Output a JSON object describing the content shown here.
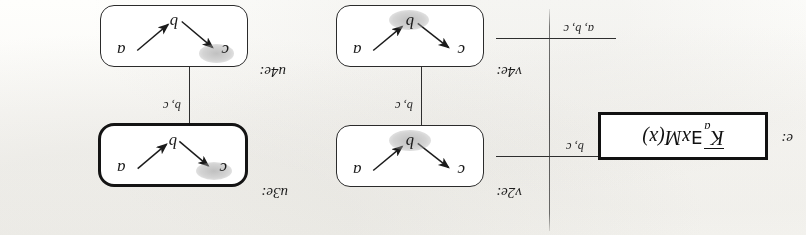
{
  "figure": {
    "orientation": "upside-down (rotated 180 degrees)",
    "worlds": [
      {
        "id": "w-top-left",
        "label": "u4e:",
        "atoms": {
          "a": "a",
          "b": "b",
          "c": "c"
        },
        "highlighted_atom": "c",
        "bold_border": false
      },
      {
        "id": "w-top-right",
        "label": "v4e:",
        "atoms": {
          "a": "a",
          "b": "b",
          "c": "c"
        },
        "highlighted_atom": "b",
        "bold_border": false
      },
      {
        "id": "w-bottom-left",
        "label": "u3e:",
        "atoms": {
          "a": "a",
          "b": "b",
          "c": "c"
        },
        "highlighted_atom": "c",
        "bold_border": true
      },
      {
        "id": "w-bottom-right",
        "label": "v2e:",
        "atoms": {
          "a": "a",
          "b": "b",
          "c": "c"
        },
        "highlighted_atom": "b",
        "bold_border": false
      }
    ],
    "edges": [
      {
        "id": "edge-top",
        "label": "a, b, c"
      },
      {
        "id": "edge-left",
        "label": "b, c"
      },
      {
        "id": "edge-right",
        "label": "b, c"
      },
      {
        "id": "edge-bottom",
        "label": "b, c"
      }
    ]
  },
  "formula_panel": {
    "label": "e:",
    "operator": "K",
    "subscript": "a",
    "quantifier": "∃",
    "variable": "x",
    "predicate": "M",
    "argument": "(x)",
    "full_text": "K ā ∃x M(x)"
  }
}
